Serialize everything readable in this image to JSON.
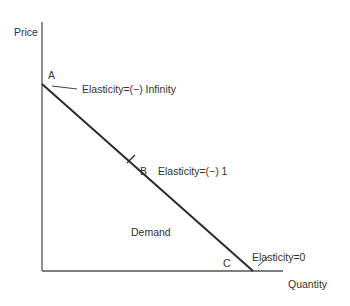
{
  "diagram": {
    "title": "",
    "axes": {
      "y_label": "Price",
      "x_label": "Quantity"
    },
    "curve": {
      "label": "Demand"
    },
    "points": [
      {
        "id": "A",
        "label": "A",
        "annotation": "Elasticity=(−) Infinity"
      },
      {
        "id": "B",
        "label": "B",
        "annotation": "Elasticity=(−) 1"
      },
      {
        "id": "C",
        "label": "C",
        "annotation": "Elasticity=0"
      }
    ],
    "colors": {
      "axis": "#555555",
      "curve": "#2a2a2a",
      "text": "#333333"
    }
  }
}
